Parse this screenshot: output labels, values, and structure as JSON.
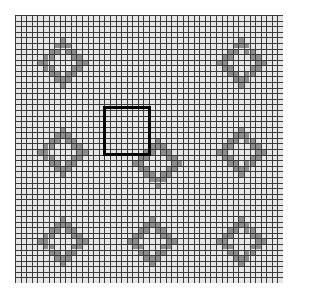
{
  "board": {
    "rows": 48,
    "cols": 48,
    "origin_px": [
      15,
      15
    ],
    "size_px": 268,
    "background_color": "#e6e6e6",
    "line_color": "#3a3a3a",
    "filled_color": "#8c8c8c"
  },
  "shapes": [
    {
      "name": "diamond-ring-top-left",
      "center_cell": [
        8,
        8
      ]
    },
    {
      "name": "diamond-ring-top-right",
      "center_cell": [
        40,
        8
      ]
    },
    {
      "name": "diamond-ring-middle-left",
      "center_cell": [
        8,
        24
      ]
    },
    {
      "name": "diamond-ring-middle-center",
      "center_cell": [
        25,
        26
      ]
    },
    {
      "name": "diamond-ring-middle-right",
      "center_cell": [
        40,
        24
      ]
    },
    {
      "name": "diamond-ring-bottom-left",
      "center_cell": [
        8,
        40
      ]
    },
    {
      "name": "diamond-ring-bottom-center",
      "center_cell": [
        24,
        40
      ]
    },
    {
      "name": "diamond-ring-bottom-right",
      "center_cell": [
        40,
        40
      ]
    }
  ],
  "shape_pattern": {
    "outer_radius": 4,
    "inner_radius": 2
  },
  "selection": {
    "x_px": 103,
    "y_px": 106,
    "width_px": 48,
    "height_px": 50,
    "border_color": "#000000"
  }
}
